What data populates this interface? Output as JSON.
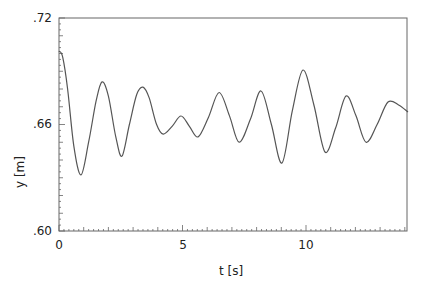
{
  "chart_data": {
    "type": "line",
    "title": "",
    "xlabel": "t [s]",
    "ylabel": "y [m]",
    "xlim": [
      0,
      14.1
    ],
    "ylim": [
      0.6,
      0.72
    ],
    "x_ticks": [
      0,
      5,
      10
    ],
    "x_tick_labels": [
      "0",
      "5",
      "10"
    ],
    "y_ticks": [
      0.6,
      0.66,
      0.72
    ],
    "y_tick_labels": [
      ".60",
      ".66",
      ".72"
    ],
    "grid": false,
    "legend": null,
    "series": [
      {
        "name": "y(t)",
        "color": "#555555",
        "x": [
          0.0,
          0.15,
          0.35,
          0.6,
          0.89,
          1.2,
          1.5,
          1.74,
          2.0,
          2.3,
          2.55,
          2.85,
          3.15,
          3.4,
          3.65,
          3.95,
          4.22,
          4.58,
          4.94,
          5.28,
          5.63,
          6.05,
          6.48,
          6.9,
          7.29,
          7.75,
          8.18,
          8.6,
          9.03,
          9.45,
          9.88,
          10.32,
          10.77,
          11.2,
          11.62,
          12.02,
          12.43,
          12.88,
          13.32,
          13.75,
          14.13
        ],
        "y": [
          0.7014,
          0.698,
          0.68,
          0.648,
          0.6316,
          0.65,
          0.673,
          0.684,
          0.676,
          0.653,
          0.6422,
          0.66,
          0.677,
          0.681,
          0.675,
          0.66,
          0.6546,
          0.659,
          0.6648,
          0.659,
          0.653,
          0.664,
          0.678,
          0.665,
          0.65,
          0.663,
          0.6789,
          0.66,
          0.6383,
          0.668,
          0.6907,
          0.671,
          0.6445,
          0.658,
          0.676,
          0.665,
          0.65,
          0.66,
          0.6727,
          0.671,
          0.667
        ]
      }
    ]
  },
  "axes": {
    "x_title": "t [s]",
    "y_title": "y [m]",
    "x_labels": [
      "0",
      "5",
      "10"
    ],
    "y_labels": [
      ".72",
      ".66",
      ".60"
    ]
  },
  "colors": {
    "axis": "#555555",
    "line": "#555555",
    "text": "#222222"
  }
}
